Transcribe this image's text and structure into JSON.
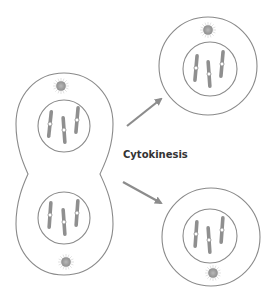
{
  "diagram": {
    "title": "Cytokinesis",
    "label": "Cytokinesis",
    "colors": {
      "outline": "#8a8a8a",
      "chromosome": "#8f8f8f",
      "centromere": "#ffffff",
      "centrosome": "#a0a0a0",
      "arrow": "#8c8c8c",
      "label": "#333333",
      "background": "#ffffff"
    },
    "parent_cell": {
      "shape": "figure-eight (dividing cell)",
      "nuclei": [
        {
          "name": "upper-nucleus",
          "chromosomes": 3
        },
        {
          "name": "lower-nucleus",
          "chromosomes": 3
        }
      ],
      "centrosomes": 2
    },
    "daughter_cells": [
      {
        "name": "daughter-cell-top",
        "chromosomes": 3,
        "centrosomes": 1
      },
      {
        "name": "daughter-cell-bottom",
        "chromosomes": 3,
        "centrosomes": 1
      }
    ],
    "arrows": [
      {
        "name": "arrow-to-top",
        "direction": "up-right"
      },
      {
        "name": "arrow-to-bottom",
        "direction": "down-right"
      }
    ]
  }
}
